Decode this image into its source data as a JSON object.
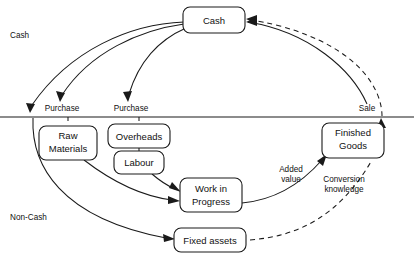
{
  "diagram": {
    "zones": [
      {
        "id": "cash",
        "label": "Cash",
        "x": 10,
        "y": 36
      },
      {
        "id": "non-cash",
        "label": "Non-Cash",
        "x": 10,
        "y": 218
      }
    ],
    "divider": {
      "y": 117,
      "x1": 0,
      "x2": 414
    },
    "nodes": [
      {
        "id": "cash-box",
        "label": "Cash",
        "x": 183,
        "y": 7,
        "w": 62,
        "h": 26,
        "lines": [
          "Cash"
        ]
      },
      {
        "id": "raw-materials",
        "label": "Raw Materials",
        "x": 39,
        "y": 126,
        "w": 58,
        "h": 34,
        "lines": [
          "Raw",
          "Materials"
        ]
      },
      {
        "id": "overheads",
        "label": "Overheads",
        "x": 108,
        "y": 124,
        "w": 62,
        "h": 24,
        "lines": [
          "Overheads"
        ]
      },
      {
        "id": "labour",
        "label": "Labour",
        "x": 114,
        "y": 151,
        "w": 50,
        "h": 23,
        "lines": [
          "Labour"
        ]
      },
      {
        "id": "work-in-progress",
        "label": "Work in Progress",
        "x": 180,
        "y": 178,
        "w": 62,
        "h": 34,
        "lines": [
          "Work in",
          "Progress"
        ]
      },
      {
        "id": "fixed-assets",
        "label": "Fixed assets",
        "x": 174,
        "y": 228,
        "w": 72,
        "h": 24,
        "lines": [
          "Fixed assets"
        ]
      },
      {
        "id": "finished-goods",
        "label": "Finished Goods",
        "x": 322,
        "y": 123,
        "w": 62,
        "h": 35,
        "lines": [
          "Finished",
          "Goods"
        ]
      }
    ],
    "edge_labels": [
      {
        "id": "purchase-1",
        "label": "Purchase",
        "x": 62,
        "y": 109
      },
      {
        "id": "purchase-2",
        "label": "Purchase",
        "x": 131,
        "y": 109
      },
      {
        "id": "sale",
        "label": "Sale",
        "x": 367,
        "y": 109
      },
      {
        "id": "added-value",
        "label": "Added",
        "x": 291,
        "y": 170
      },
      {
        "id": "added-value-2",
        "label": "value",
        "x": 291,
        "y": 180
      },
      {
        "id": "conversion-knowledge",
        "label": "Conversion",
        "x": 344,
        "y": 180
      },
      {
        "id": "conversion-knowledge-2",
        "label": "knowledge",
        "x": 344,
        "y": 190
      }
    ],
    "edges": [
      {
        "id": "cash-to-raw-materials-left",
        "type": "solid",
        "from": "cash-box",
        "to": "below-line-left"
      },
      {
        "id": "cash-to-purchase-1",
        "type": "solid",
        "from": "cash-box",
        "to": "purchase-1"
      },
      {
        "id": "cash-to-purchase-2",
        "type": "solid",
        "from": "cash-box",
        "to": "purchase-2"
      },
      {
        "id": "overheads-to-labour",
        "type": "solid",
        "from": "overheads",
        "to": "labour"
      },
      {
        "id": "labour-to-wip",
        "type": "solid",
        "from": "labour",
        "to": "work-in-progress"
      },
      {
        "id": "raw-materials-to-wip",
        "type": "solid",
        "from": "raw-materials",
        "to": "work-in-progress"
      },
      {
        "id": "left-curve-to-fixed-assets",
        "type": "solid",
        "from": "below-line-left",
        "to": "fixed-assets"
      },
      {
        "id": "wip-to-finished-goods",
        "type": "solid",
        "from": "work-in-progress",
        "to": "finished-goods"
      },
      {
        "id": "finished-goods-to-cash",
        "type": "solid",
        "from": "finished-goods",
        "to": "cash-box"
      },
      {
        "id": "fixed-assets-to-cash",
        "type": "dashed",
        "from": "fixed-assets",
        "to": "cash-box"
      }
    ],
    "colors": {
      "stroke": "#1a1a1a",
      "fill": "#ffffff",
      "text": "#111111"
    }
  }
}
